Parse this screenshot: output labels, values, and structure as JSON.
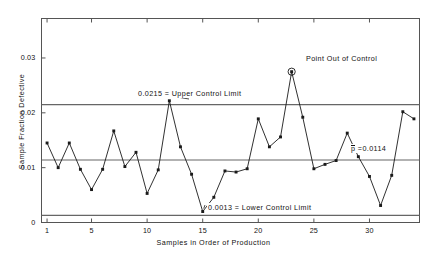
{
  "chart_data": {
    "type": "line",
    "title": "",
    "xlabel": "Samples in Order of Production",
    "ylabel": "Sample Fraction Defective",
    "xlim": [
      0.5,
      34.5
    ],
    "ylim": [
      0,
      0.0372
    ],
    "grid": false,
    "legend": "none",
    "x": [
      1,
      2,
      3,
      4,
      5,
      6,
      7,
      8,
      9,
      10,
      11,
      12,
      13,
      14,
      15,
      16,
      17,
      18,
      19,
      20,
      21,
      22,
      23,
      24,
      25,
      26,
      27,
      28,
      29,
      30,
      31,
      32,
      33,
      34
    ],
    "values": [
      0.0145,
      0.01,
      0.0145,
      0.0097,
      0.006,
      0.0097,
      0.0167,
      0.0102,
      0.0128,
      0.0053,
      0.0096,
      0.0222,
      0.0138,
      0.0088,
      0.002,
      0.0046,
      0.0094,
      0.0092,
      0.0098,
      0.0189,
      0.0138,
      0.0156,
      0.0275,
      0.0192,
      0.0098,
      0.0106,
      0.0113,
      0.0163,
      0.012,
      0.0084,
      0.0031,
      0.0086,
      0.0202,
      0.0189
    ],
    "categories": [
      "1",
      "2",
      "3",
      "4",
      "5",
      "6",
      "7",
      "8",
      "9",
      "10",
      "11",
      "12",
      "13",
      "14",
      "15",
      "16",
      "17",
      "18",
      "19",
      "20",
      "21",
      "22",
      "23",
      "24",
      "25",
      "26",
      "27",
      "28",
      "29",
      "30",
      "31",
      "32",
      "33",
      "34"
    ],
    "yticks": [
      {
        "value": 0,
        "label": "0"
      },
      {
        "value": 0.01,
        "label": "0.01"
      },
      {
        "value": 0.02,
        "label": "0.02"
      },
      {
        "value": 0.03,
        "label": "0.03"
      }
    ],
    "xticks": [
      {
        "value": 1,
        "label": "1"
      },
      {
        "value": 5,
        "label": "5"
      },
      {
        "value": 10,
        "label": "10"
      },
      {
        "value": 15,
        "label": "15"
      },
      {
        "value": 20,
        "label": "20"
      },
      {
        "value": 25,
        "label": "25"
      },
      {
        "value": 30,
        "label": "30"
      }
    ],
    "reference_lines": [
      {
        "name": "upper-control-limit",
        "value": 0.0215,
        "label": "0.0215 = Upper Control Limit"
      },
      {
        "name": "center-line",
        "value": 0.0114,
        "label": "p =0.0114"
      },
      {
        "name": "lower-control-limit",
        "value": 0.0013,
        "label": "0.0013 = Lower Control Limit"
      }
    ],
    "annotations": [
      {
        "name": "point-out-of-control",
        "text": "Point Out of Control",
        "x": 23,
        "y": 0.0275
      }
    ],
    "highlighted_point": {
      "x": 23,
      "y": 0.0275,
      "marker": "circled"
    },
    "colors": {
      "line": "#1a1a1a",
      "marker": "#1a1a1a",
      "reference_line": "#666666",
      "axis": "#555555",
      "background": "#ffffff"
    }
  },
  "labels": {
    "ucl_annotation": "0.0215 = Upper Control Limit",
    "lcl_annotation": "0.0013 = Lower Control Limit",
    "pbar_p": "p",
    "pbar_value": " =0.0114",
    "out_of_control": "Point Out of Control"
  }
}
